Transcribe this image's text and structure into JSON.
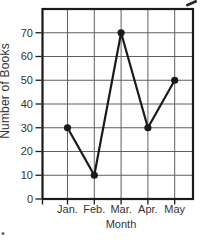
{
  "chart_data": {
    "type": "line",
    "xlabel": "Month",
    "ylabel": "Number of Books",
    "categories": [
      "Jan.",
      "Feb.",
      "Mar.",
      "Apr.",
      "May"
    ],
    "values": [
      30,
      10,
      70,
      30,
      50
    ],
    "series": [
      {
        "name": "Number of Books",
        "values": [
          30,
          10,
          70,
          30,
          50
        ]
      }
    ],
    "yticks": [
      0,
      10,
      20,
      30,
      40,
      50,
      60,
      70
    ],
    "ylim": [
      0,
      80
    ],
    "grid": true,
    "legend": false,
    "marker": "filled-circle",
    "colors": {
      "line": "#1a1a1a",
      "marker": "#1a1a1a",
      "grid": "#5f5f5f",
      "border": "#1a1a1a",
      "text": "#333333",
      "background": "#ffffff"
    }
  }
}
